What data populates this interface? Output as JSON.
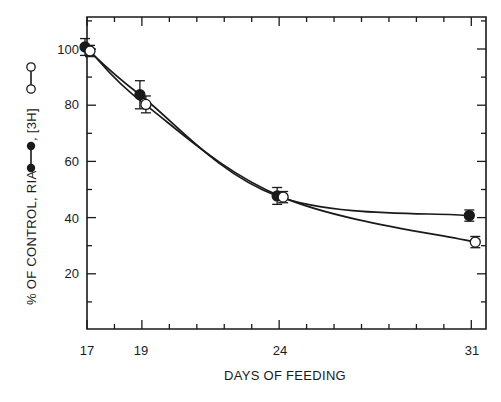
{
  "chart_data": {
    "type": "line",
    "title": "",
    "xlabel": "DAYS OF FEEDING",
    "ylabel": "% OF CONTROL, RIA ●—●, [3H] ○—○",
    "ylabel_parts": {
      "prefix": "% OF CONTROL, RIA",
      "middle": ", [3H]"
    },
    "x_ticks": [
      17,
      19,
      24,
      31
    ],
    "y_ticks": [
      20,
      40,
      60,
      80,
      100
    ],
    "xlim": [
      17,
      31.5
    ],
    "ylim": [
      0,
      112
    ],
    "grid": false,
    "legend_position": "inline-in-ylabel",
    "x": [
      17,
      19,
      24,
      31
    ],
    "series": [
      {
        "name": "RIA",
        "marker": "filled-circle",
        "values": [
          100,
          83,
          47,
          40
        ],
        "error": [
          3,
          5,
          3,
          2
        ]
      },
      {
        "name": "[3H]",
        "marker": "open-circle",
        "values": [
          100,
          81,
          48,
          32
        ],
        "error": [
          2,
          3,
          2,
          2
        ]
      }
    ]
  },
  "labels": {
    "x_axis_title": "DAYS OF FEEDING",
    "y_title_prefix": "% OF CONTROL, RIA",
    "y_title_mid": ", [3H]",
    "x_ticks": [
      "17",
      "19",
      "24",
      "31"
    ],
    "y_ticks": [
      "20",
      "40",
      "60",
      "80",
      "100"
    ]
  }
}
